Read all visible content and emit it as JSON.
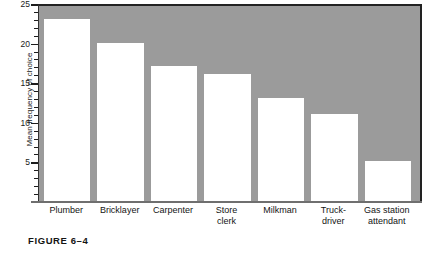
{
  "caption": "FIGURE 6–4",
  "chart_data": {
    "type": "bar",
    "title": "",
    "xlabel": "",
    "ylabel": "Mean frequency of choice",
    "categories": [
      "Plumber",
      "Bricklayer",
      "Carpenter",
      "Store clerk",
      "Milkman",
      "Truck-driver",
      "Gas station attendant"
    ],
    "category_lines": [
      [
        "Plumber"
      ],
      [
        "Bricklayer"
      ],
      [
        "Carpenter"
      ],
      [
        "Store",
        "clerk"
      ],
      [
        "Milkman"
      ],
      [
        "Truck-",
        "driver"
      ],
      [
        "Gas station",
        "attendant"
      ]
    ],
    "values": [
      23,
      20,
      17,
      16,
      13,
      11,
      5
    ],
    "ylim": [
      0,
      25
    ],
    "y_major_ticks": [
      5,
      10,
      15,
      20,
      25
    ],
    "y_minor_tick_step": 1,
    "grid": false,
    "legend": "none",
    "bar_color": "#ffffff",
    "plot_background": "#9b9b9b",
    "axis_color": "#222222"
  }
}
